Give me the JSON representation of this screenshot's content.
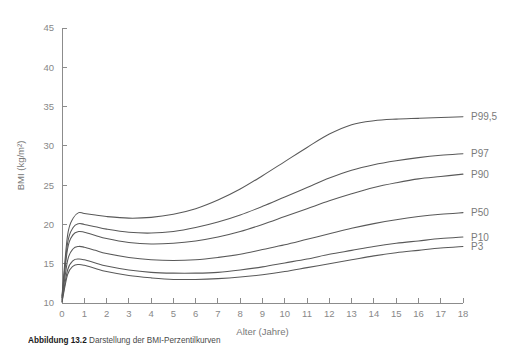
{
  "chart_data": {
    "type": "line",
    "title": "",
    "xlabel": "Alter (Jahre)",
    "ylabel": "BMI (kg/m²)",
    "xlim": [
      0,
      18
    ],
    "ylim": [
      10,
      45
    ],
    "xticks": [
      0,
      1,
      2,
      3,
      4,
      5,
      6,
      7,
      8,
      9,
      10,
      11,
      12,
      13,
      14,
      15,
      16,
      17,
      18
    ],
    "yticks": [
      10,
      15,
      20,
      25,
      30,
      35,
      40,
      45
    ],
    "grid": false,
    "legend_position": "right-inline-labels",
    "x": [
      0,
      0.25,
      0.5,
      0.75,
      1,
      1.5,
      2,
      3,
      4,
      5,
      6,
      7,
      8,
      9,
      10,
      11,
      12,
      13,
      14,
      15,
      16,
      17,
      18
    ],
    "series": [
      {
        "name": "P99,5",
        "label": "P99,5",
        "values": [
          10.9,
          18.6,
          20.8,
          21.5,
          21.4,
          21.2,
          21.0,
          20.8,
          20.9,
          21.3,
          22.0,
          23.1,
          24.5,
          26.2,
          28.0,
          29.8,
          31.5,
          32.7,
          33.2,
          33.4,
          33.5,
          33.6,
          33.7
        ]
      },
      {
        "name": "P97",
        "label": "P97",
        "values": [
          10.7,
          17.6,
          19.6,
          20.1,
          20.0,
          19.7,
          19.4,
          19.0,
          18.9,
          19.1,
          19.6,
          20.3,
          21.2,
          22.3,
          23.5,
          24.7,
          25.9,
          26.9,
          27.6,
          28.1,
          28.5,
          28.8,
          29.0
        ]
      },
      {
        "name": "P90",
        "label": "P90",
        "values": [
          10.6,
          16.9,
          18.7,
          19.1,
          19.0,
          18.6,
          18.2,
          17.7,
          17.5,
          17.6,
          17.9,
          18.4,
          19.1,
          20.0,
          21.0,
          22.0,
          23.0,
          23.9,
          24.7,
          25.3,
          25.8,
          26.1,
          26.4
        ]
      },
      {
        "name": "P50",
        "label": "P50",
        "values": [
          10.4,
          15.4,
          16.9,
          17.2,
          17.1,
          16.7,
          16.3,
          15.8,
          15.5,
          15.4,
          15.5,
          15.8,
          16.2,
          16.8,
          17.4,
          18.1,
          18.8,
          19.5,
          20.1,
          20.6,
          21.0,
          21.3,
          21.5
        ]
      },
      {
        "name": "P10",
        "label": "P10",
        "values": [
          10.2,
          14.2,
          15.4,
          15.6,
          15.5,
          15.1,
          14.7,
          14.2,
          13.9,
          13.8,
          13.8,
          13.9,
          14.2,
          14.6,
          15.1,
          15.6,
          16.2,
          16.7,
          17.2,
          17.6,
          17.9,
          18.2,
          18.4
        ]
      },
      {
        "name": "P3",
        "label": "P3",
        "values": [
          10.1,
          13.6,
          14.7,
          14.9,
          14.8,
          14.4,
          14.0,
          13.5,
          13.2,
          13.0,
          13.0,
          13.1,
          13.3,
          13.6,
          14.0,
          14.5,
          15.0,
          15.5,
          16.0,
          16.4,
          16.7,
          17.0,
          17.2
        ]
      }
    ]
  },
  "caption": {
    "figure_number": "Abbildung 13.2",
    "text": "Darstellung der BMI-Perzentilkurven"
  },
  "colors": {
    "curve": "#595959",
    "axis": "#8c8c8c",
    "tick_label": "#888888",
    "background": "#ffffff"
  }
}
